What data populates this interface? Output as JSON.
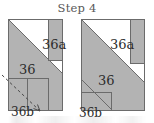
{
  "page": {
    "title": "Step 4",
    "background_color": "#ffffff"
  },
  "palette": {
    "fabric_fill": "#b3b3b3",
    "fabric_fill_light": "#bdbdbd",
    "white_fill": "#ffffff",
    "outline": "#6b6b6b",
    "label_color": "#2b2b2b",
    "title_color": "#585858",
    "arrow_color": "#4a4a4a"
  },
  "diagrams": [
    {
      "id": "left-unit",
      "name": "left-block-before",
      "labels": [
        {
          "key": "a",
          "text": "36a",
          "x": 42,
          "y": 22,
          "size": "big"
        },
        {
          "key": "main",
          "text": "36",
          "x": 19,
          "y": 47,
          "size": "big"
        },
        {
          "key": "b",
          "text": "36b",
          "x": 11,
          "y": 90,
          "size": "mid"
        }
      ],
      "has_arrow": true,
      "arrow_note": "dashed fold/flip arrow over 36b"
    },
    {
      "id": "right-unit",
      "name": "right-block-after",
      "labels": [
        {
          "key": "a",
          "text": "36a",
          "x": 110,
          "y": 22,
          "size": "big"
        },
        {
          "key": "main",
          "text": "36",
          "x": 98,
          "y": 58,
          "size": "big"
        },
        {
          "key": "b",
          "text": "36b",
          "x": 79,
          "y": 91,
          "size": "mid"
        }
      ],
      "has_arrow": false,
      "arrow_note": ""
    }
  ]
}
